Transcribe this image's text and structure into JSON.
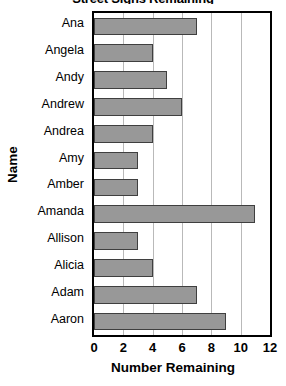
{
  "chart_data": {
    "type": "bar",
    "orientation": "horizontal",
    "title": "Street Signs Remaining",
    "xlabel": "Number Remaining",
    "ylabel": "Name",
    "categories": [
      "Ana",
      "Angela",
      "Andy",
      "Andrew",
      "Andrea",
      "Amy",
      "Amber",
      "Amanda",
      "Allison",
      "Alicia",
      "Adam",
      "Aaron"
    ],
    "values": [
      7,
      4,
      5,
      6,
      4,
      3,
      3,
      11,
      3,
      4,
      7,
      9
    ],
    "xlim": [
      0,
      12
    ],
    "xticks": [
      0,
      2,
      4,
      6,
      8,
      10,
      12
    ],
    "xtick_labels": [
      "0",
      "2",
      "4",
      "6",
      "8",
      "10",
      "12"
    ],
    "grid": "vertical",
    "legend": "none",
    "bar_color": "#989898",
    "bar_edge_color": "#3f3f3f",
    "gridline_color": "#b9b9b9",
    "axis_color": "#000000",
    "background": "#ffffff"
  }
}
